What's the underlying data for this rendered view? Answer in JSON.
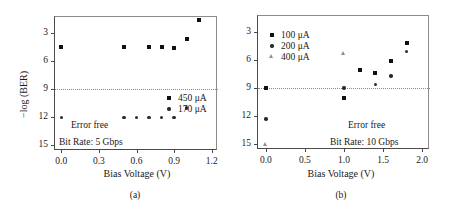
{
  "figure": {
    "panels": [
      {
        "id": "a",
        "caption": "(a)",
        "xlabel": "Bias Voltage (V)",
        "ylabel": "−log (BER)",
        "show_ylabel": true,
        "annotations": {
          "error_free": "Error free",
          "bit_rate": "Bit Rate: 5 Gbps"
        },
        "chart_data": {
          "type": "scatter",
          "title": "",
          "xlabel": "Bias Voltage (V)",
          "ylabel": "−log (BER)",
          "xlim": [
            -0.05,
            1.25
          ],
          "ylim": [
            1.3,
            15.6
          ],
          "y_inverted": true,
          "xticks": [
            "0.0",
            "0.3",
            "0.6",
            "0.9",
            "1.2"
          ],
          "xtick_values": [
            0.0,
            0.3,
            0.6,
            0.9,
            1.2
          ],
          "yticks": [
            "3",
            "6",
            "9",
            "12",
            "15"
          ],
          "ytick_values": [
            3,
            6,
            9,
            12,
            15
          ],
          "grid": false,
          "legend_position": "center-right",
          "reference_line": {
            "y": 9,
            "style": "dotted",
            "label": "Error free"
          },
          "series": [
            {
              "name": "450 μA",
              "marker": "square",
              "points": [
                {
                  "x": 0.0,
                  "y": 4.5
                },
                {
                  "x": 0.5,
                  "y": 4.5
                },
                {
                  "x": 0.7,
                  "y": 4.5
                },
                {
                  "x": 0.8,
                  "y": 4.5
                },
                {
                  "x": 0.9,
                  "y": 4.6
                },
                {
                  "x": 1.0,
                  "y": 3.7
                },
                {
                  "x": 1.1,
                  "y": 1.6
                }
              ]
            },
            {
              "name": "170 μA",
              "marker": "circle",
              "points": [
                {
                  "x": 0.0,
                  "y": 12.0
                },
                {
                  "x": 0.5,
                  "y": 12.0
                },
                {
                  "x": 0.6,
                  "y": 12.0
                },
                {
                  "x": 0.7,
                  "y": 12.0
                },
                {
                  "x": 0.8,
                  "y": 12.0
                },
                {
                  "x": 0.9,
                  "y": 12.0
                },
                {
                  "x": 1.0,
                  "y": 11.0
                }
              ]
            }
          ]
        }
      },
      {
        "id": "b",
        "caption": "(b)",
        "xlabel": "Bias Voltage (V)",
        "ylabel": "",
        "show_ylabel": false,
        "annotations": {
          "error_free": "Error free",
          "bit_rate": "Bit Rate: 10 Gbps"
        },
        "chart_data": {
          "type": "scatter",
          "title": "",
          "xlabel": "Bias Voltage (V)",
          "ylabel": "−log (BER)",
          "xlim": [
            -0.1,
            2.1
          ],
          "ylim": [
            1.3,
            15.6
          ],
          "y_inverted": true,
          "xticks": [
            "0.0",
            "0.5",
            "1.0",
            "1.5",
            "2.0"
          ],
          "xtick_values": [
            0.0,
            0.5,
            1.0,
            1.5,
            2.0
          ],
          "yticks": [
            "3",
            "6",
            "9",
            "12",
            "15"
          ],
          "ytick_values": [
            3,
            6,
            9,
            12,
            15
          ],
          "grid": false,
          "legend_position": "top-left",
          "reference_line": {
            "y": 9,
            "style": "dotted",
            "label": "Error free"
          },
          "series": [
            {
              "name": "100 μA",
              "marker": "square",
              "points": [
                {
                  "x": 0.0,
                  "y": 9.0
                },
                {
                  "x": 1.0,
                  "y": 10.0
                },
                {
                  "x": 1.2,
                  "y": 7.1
                },
                {
                  "x": 1.4,
                  "y": 7.4
                },
                {
                  "x": 1.6,
                  "y": 6.1
                },
                {
                  "x": 1.8,
                  "y": 4.2
                }
              ]
            },
            {
              "name": "200 μA",
              "marker": "circle",
              "points": [
                {
                  "x": 0.0,
                  "y": 12.3
                },
                {
                  "x": 1.0,
                  "y": 9.0
                },
                {
                  "x": 1.4,
                  "y": 8.6
                },
                {
                  "x": 1.6,
                  "y": 7.7
                },
                {
                  "x": 1.8,
                  "y": 5.1
                }
              ]
            },
            {
              "name": "400 μA",
              "marker": "triangle",
              "points": [
                {
                  "x": 0.0,
                  "y": 15.0
                },
                {
                  "x": 1.0,
                  "y": 5.3
                }
              ]
            }
          ]
        }
      }
    ]
  }
}
